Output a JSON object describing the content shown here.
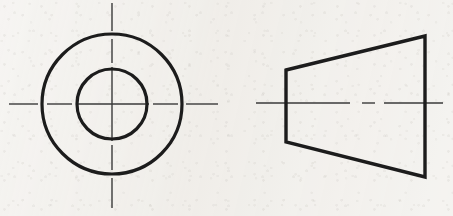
{
  "sheet": {
    "width": 453,
    "height": 216,
    "background_color": "#f1efeb",
    "line_color": "#1c1c1c",
    "centerline_color": "#3a3a3a",
    "title": "Two-view orthographic drawing: truncated cone (frustum)"
  },
  "views": [
    {
      "id": "front-view",
      "name": "Front View (Concentric Circles)",
      "type": "circles",
      "center": {
        "x": 112,
        "y": 104
      },
      "object_line_width": 3.2,
      "circles": [
        {
          "id": "outer-circle",
          "name": "Outer Circle (large end diameter)",
          "radius": 70
        },
        {
          "id": "inner-circle",
          "name": "Inner Circle (small end diameter)",
          "radius": 35
        }
      ],
      "centerlines": {
        "line_width": 1.4,
        "vertical": {
          "x": 112,
          "y_start": 3,
          "y_end": 208,
          "segments": [
            {
              "from": 3,
              "to": 31
            },
            {
              "from": 39,
              "to": 63
            },
            {
              "from": 67,
              "to": 141
            },
            {
              "from": 145,
              "to": 170
            },
            {
              "from": 178,
              "to": 208
            }
          ]
        },
        "horizontal": {
          "y": 104,
          "x_start": 9,
          "x_end": 218,
          "segments": [
            {
              "from": 9,
              "to": 38
            },
            {
              "from": 47,
              "to": 72
            },
            {
              "from": 76,
              "to": 149
            },
            {
              "from": 153,
              "to": 178
            },
            {
              "from": 186,
              "to": 218
            }
          ]
        }
      }
    },
    {
      "id": "side-view",
      "name": "Side View (Trapezoid / Frustum Profile)",
      "type": "polygon",
      "object_line_width": 3.4,
      "vertices": [
        {
          "x": 286,
          "y": 70,
          "name": "top-left-corner"
        },
        {
          "x": 425,
          "y": 36,
          "name": "top-right-corner"
        },
        {
          "x": 425,
          "y": 177,
          "name": "bottom-right-corner"
        },
        {
          "x": 286,
          "y": 142,
          "name": "bottom-left-corner"
        }
      ],
      "edges": [
        {
          "id": "top-slant-edge",
          "name": "Top Slanted Edge"
        },
        {
          "id": "right-vertical-edge",
          "name": "Right Vertical Edge (large end)"
        },
        {
          "id": "bottom-slant-edge",
          "name": "Bottom Slanted Edge"
        },
        {
          "id": "left-vertical-edge",
          "name": "Left Vertical Edge (small end)"
        }
      ],
      "axis_centerline": {
        "name": "Axis Centerline (dash-dot)",
        "y": 103,
        "x_start": 256,
        "x_end": 443,
        "line_width": 1.4,
        "segments": [
          {
            "from": 256,
            "to": 350,
            "kind": "long-dash"
          },
          {
            "from": 362,
            "to": 375,
            "kind": "short-dash"
          },
          {
            "from": 384,
            "to": 443,
            "kind": "long-dash"
          }
        ]
      }
    }
  ]
}
